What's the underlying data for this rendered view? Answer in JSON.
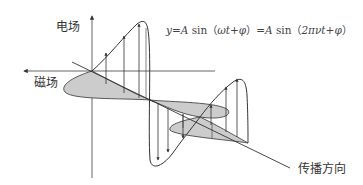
{
  "diagram": {
    "labels": {
      "electric_field": "电场",
      "magnetic_field": "磁场",
      "propagation_direction": "传播方向"
    },
    "formula": {
      "part1_var": "y",
      "part1_eq": "=",
      "part1_amp": "A",
      "part1_sin": " sin（",
      "part1_arg": "ωt+φ",
      "part1_close": "）=",
      "part2_amp": "A",
      "part2_sin": " sin（",
      "part2_arg": "2πνt+φ",
      "part2_close": "）"
    },
    "colors": {
      "line": "#333333",
      "fill": "#cccccc",
      "axis": "#555555"
    }
  }
}
